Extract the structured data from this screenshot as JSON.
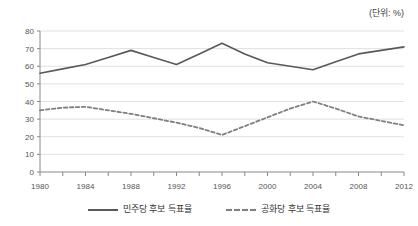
{
  "unit_note": "(단위: %)",
  "chart_data": {
    "type": "line",
    "title": "",
    "subtitle": "",
    "xlabel": "",
    "ylabel": "",
    "unit": "(단위: %)",
    "grid": true,
    "legend_position": "bottom",
    "xlim": [
      1980,
      2012
    ],
    "ylim": [
      0,
      80
    ],
    "yticks": [
      0,
      10,
      20,
      30,
      40,
      50,
      60,
      70,
      80
    ],
    "ytick_labels": [
      "0",
      "10",
      "20",
      "30",
      "40",
      "50",
      "60",
      "70",
      "80"
    ],
    "xticks": [
      1980,
      1982,
      1984,
      1986,
      1988,
      1990,
      1992,
      1994,
      1996,
      1998,
      2000,
      2002,
      2004,
      2006,
      2008,
      2010,
      2012
    ],
    "xtick_labels": [
      "1980",
      "1984",
      "1988",
      "1992",
      "1996",
      "2000",
      "2004",
      "2008",
      "2012"
    ],
    "xtick_label_values": [
      1980,
      1984,
      1988,
      1992,
      1996,
      2000,
      2004,
      2008,
      2012
    ],
    "x": [
      1980,
      1982,
      1984,
      1986,
      1988,
      1990,
      1992,
      1994,
      1996,
      1998,
      2000,
      2002,
      2004,
      2006,
      2008,
      2010,
      2012
    ],
    "series": [
      {
        "name": "민주당 후보 득표율",
        "style": "solid",
        "color": "#595959",
        "values": [
          56,
          58.5,
          61,
          65,
          69,
          65,
          61,
          67,
          73,
          67,
          62,
          60,
          58,
          62.5,
          67,
          69,
          71
        ]
      },
      {
        "name": "공화당 후보 득표율",
        "style": "dashed",
        "color": "#7f7f7f",
        "values": [
          35,
          36.5,
          37,
          35,
          33,
          30.5,
          28,
          25,
          21,
          26,
          31,
          36,
          40,
          36,
          31.5,
          29,
          26.5
        ]
      }
    ]
  },
  "legend": {
    "items": [
      {
        "label": "민주당 후보 득표율",
        "style": "solid"
      },
      {
        "label": "공화당 후보 득표율",
        "style": "dashed"
      }
    ]
  },
  "colors": {
    "series_solid": "#595959",
    "series_dashed": "#7f7f7f",
    "gridline": "#e0e0e0",
    "axis": "#888888",
    "text": "#555555",
    "background": "#ffffff"
  }
}
